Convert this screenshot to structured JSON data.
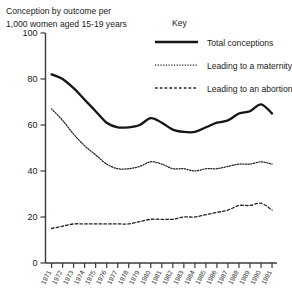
{
  "chart_data": {
    "type": "line",
    "title": "Conception by outcome per 1,000 women aged 15-19 years",
    "title_line1": "Conception by outcome per",
    "title_line2": "1,000 women aged 15-19 years",
    "xlabel": "",
    "ylabel": "Conception by outcome per 1,000 women aged 15-19 years",
    "ylim": [
      0,
      100
    ],
    "ytick_labels": [
      "0",
      "20",
      "40",
      "60",
      "80",
      "100"
    ],
    "yticks": [
      0,
      20,
      40,
      60,
      80,
      100
    ],
    "grid": false,
    "legend_position": "top-right",
    "legend_title": "Key",
    "categories": [
      "1971",
      "1972",
      "1973",
      "1974",
      "1975",
      "1976",
      "1977",
      "1978",
      "1979",
      "1980",
      "1981",
      "1982",
      "1983",
      "1984",
      "1985",
      "1986",
      "1987",
      "1988",
      "1989",
      "1990",
      "1991"
    ],
    "series": [
      {
        "name": "Total conceptions",
        "style": "solid",
        "values": [
          82,
          80,
          76,
          71,
          66,
          61,
          59,
          59,
          60,
          63,
          61,
          58,
          57,
          57,
          59,
          61,
          62,
          65,
          66,
          69,
          65
        ]
      },
      {
        "name": "Leading to a maternity",
        "style": "dotted",
        "values": [
          67,
          62,
          56,
          51,
          47,
          43,
          41,
          41,
          42,
          44,
          43,
          41,
          41,
          40,
          41,
          41,
          42,
          43,
          43,
          44,
          43
        ]
      },
      {
        "name": "Leading to an abortion",
        "style": "dashed",
        "values": [
          15,
          16,
          17,
          17,
          17,
          17,
          17,
          17,
          18,
          19,
          19,
          19,
          20,
          20,
          21,
          22,
          23,
          25,
          25,
          26,
          23
        ]
      }
    ]
  },
  "legend": {
    "title": "Key",
    "items": [
      {
        "label": "Total conceptions",
        "icon": "solid-line-swatch"
      },
      {
        "label": "Leading to a maternity",
        "icon": "dotted-line-swatch"
      },
      {
        "label": "Leading to an abortion",
        "icon": "dashed-line-swatch"
      }
    ]
  },
  "colors": {
    "background": "#ffffff",
    "axis": "#3a3a3a",
    "total_conceptions": "#151515",
    "maternity": "#202020",
    "abortion": "#202020"
  }
}
